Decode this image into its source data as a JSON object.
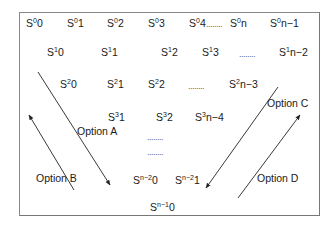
{
  "diagram": {
    "rows": [
      [
        {
          "base": "S",
          "sup": "0",
          "sub": "0",
          "x": 26,
          "y": 17
        },
        {
          "base": "S",
          "sup": "0",
          "sub": "1",
          "x": 67,
          "y": 17
        },
        {
          "base": "S",
          "sup": "0",
          "sub": "2",
          "x": 107,
          "y": 17
        },
        {
          "base": "S",
          "sup": "0",
          "sub": "3",
          "x": 148,
          "y": 17
        },
        {
          "base": "S",
          "sup": "0",
          "sub": "4",
          "x": 189,
          "y": 17
        },
        {
          "base": "S",
          "sup": "0",
          "sub": "n",
          "x": 230,
          "y": 17
        },
        {
          "base": "S",
          "sup": "0",
          "sub": "n−1",
          "x": 270,
          "y": 17
        }
      ],
      [
        {
          "base": "S",
          "sup": "1",
          "sub": "0",
          "x": 47,
          "y": 46
        },
        {
          "base": "S",
          "sup": "1",
          "sub": "1",
          "x": 101,
          "y": 46
        },
        {
          "base": "S",
          "sup": "1",
          "sub": "2",
          "x": 161,
          "y": 46
        },
        {
          "base": "S",
          "sup": "1",
          "sub": "3",
          "x": 202,
          "y": 46
        },
        {
          "base": "S",
          "sup": "1",
          "sub": "n−2",
          "x": 279,
          "y": 46
        }
      ],
      [
        {
          "base": "S",
          "sup": "2",
          "sub": "0",
          "x": 60,
          "y": 78
        },
        {
          "base": "S",
          "sup": "2",
          "sub": "1",
          "x": 107,
          "y": 78
        },
        {
          "base": "S",
          "sup": "2",
          "sub": "2",
          "x": 148,
          "y": 78
        },
        {
          "base": "S",
          "sup": "2",
          "sub": "n−3",
          "x": 229,
          "y": 78
        }
      ],
      [
        {
          "base": "S",
          "sup": "3",
          "sub": "1",
          "x": 108,
          "y": 111
        },
        {
          "base": "S",
          "sup": "3",
          "sub": "2",
          "x": 156,
          "y": 111
        },
        {
          "base": "S",
          "sup": "3",
          "sub": "n−4",
          "x": 195,
          "y": 111
        }
      ],
      [
        {
          "base": "S",
          "sup": "n−2",
          "sub": "0",
          "x": 133,
          "y": 174
        },
        {
          "base": "S",
          "sup": "n−2",
          "sub": "1",
          "x": 175,
          "y": 174
        }
      ],
      [
        {
          "base": "S",
          "sup": "n−1",
          "sub": "0",
          "x": 150,
          "y": 201
        }
      ]
    ],
    "ellipses": [
      {
        "text": "........",
        "x": 206,
        "y": 19
      },
      {
        "text": "........",
        "x": 239,
        "y": 49
      },
      {
        "text": "........",
        "x": 188,
        "y": 81
      },
      {
        "text": "........",
        "x": 147,
        "y": 132
      },
      {
        "text": "........",
        "x": 147,
        "y": 147
      }
    ],
    "options": [
      {
        "id": "A",
        "label": "Option A",
        "x": 77,
        "y": 125
      },
      {
        "id": "B",
        "label": "Option B",
        "x": 36,
        "y": 172
      },
      {
        "id": "C",
        "label": "Option C",
        "x": 267,
        "y": 97
      },
      {
        "id": "D",
        "label": "Option D",
        "x": 257,
        "y": 172
      }
    ],
    "arrows": [
      {
        "name": "option-a-arrow",
        "x1": 38,
        "y1": 72,
        "x2": 110,
        "y2": 185,
        "head": "end"
      },
      {
        "name": "option-b-arrow",
        "x1": 74,
        "y1": 190,
        "x2": 29,
        "y2": 115,
        "head": "end"
      },
      {
        "name": "option-c-arrow",
        "x1": 278,
        "y1": 87,
        "x2": 206,
        "y2": 188,
        "head": "end"
      },
      {
        "name": "option-d-arrow",
        "x1": 238,
        "y1": 198,
        "x2": 300,
        "y2": 115,
        "head": "end"
      }
    ],
    "colors": {
      "line": "#222222",
      "frame": "#7a7a7a",
      "text": "#1a1a1a",
      "dots": "#666666"
    }
  }
}
